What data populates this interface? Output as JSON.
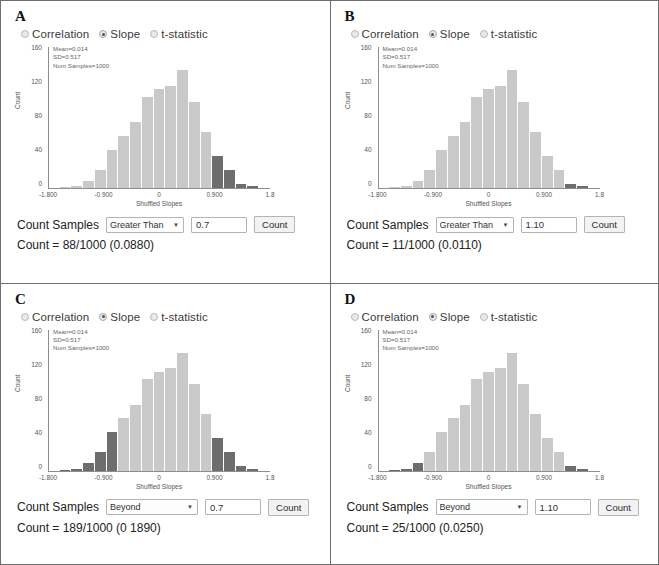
{
  "figure": {
    "panels": [
      {
        "letter": "A",
        "radios": [
          {
            "label": "Correlation",
            "selected": false,
            "italic_first": false
          },
          {
            "label": "Slope",
            "selected": true,
            "italic_first": false
          },
          {
            "label": "t-statistic",
            "selected": false,
            "italic_first": true
          }
        ],
        "stats": {
          "mean": "Mean=0.014",
          "sd": "SD=0.517",
          "num": "Num Samples=1000"
        },
        "controls": {
          "label": "Count Samples",
          "dropdown_value": "Greater Than",
          "dropdown_options": [
            "Greater Than",
            "Less Than",
            "Beyond",
            "Between"
          ],
          "input_value": "0.7",
          "button": "Count"
        },
        "result": "Count = 88/1000 (0.0880)"
      },
      {
        "letter": "B",
        "radios": [
          {
            "label": "Correlation",
            "selected": false,
            "italic_first": false
          },
          {
            "label": "Slope",
            "selected": true,
            "italic_first": false
          },
          {
            "label": "t-statistic",
            "selected": false,
            "italic_first": true
          }
        ],
        "stats": {
          "mean": "Mean=0.014",
          "sd": "SD=0.517",
          "num": "Num Samples=1000"
        },
        "controls": {
          "label": "Count Samples",
          "dropdown_value": "Greater Than",
          "dropdown_options": [
            "Greater Than",
            "Less Than",
            "Beyond",
            "Between"
          ],
          "input_value": "1.10",
          "button": "Count"
        },
        "result": "Count = 11/1000 (0.0110)"
      },
      {
        "letter": "C",
        "radios": [
          {
            "label": "Correlation",
            "selected": false,
            "italic_first": false
          },
          {
            "label": "Slope",
            "selected": true,
            "italic_first": false
          },
          {
            "label": "t-statistic",
            "selected": false,
            "italic_first": true
          }
        ],
        "stats": {
          "mean": "Mean=0.014",
          "sd": "SD=0.517",
          "num": "Num Samples=1000"
        },
        "controls": {
          "label": "Count Samples",
          "dropdown_value": "Beyond",
          "dropdown_options": [
            "Greater Than",
            "Less Than",
            "Beyond",
            "Between"
          ],
          "input_value": "0.7",
          "button": "Count"
        },
        "result": "Count = 189/1000 (0 1890)"
      },
      {
        "letter": "D",
        "radios": [
          {
            "label": "Correlation",
            "selected": false,
            "italic_first": false
          },
          {
            "label": "Slope",
            "selected": true,
            "italic_first": false
          },
          {
            "label": "t-statistic",
            "selected": false,
            "italic_first": true
          }
        ],
        "stats": {
          "mean": "Mean=0.014",
          "sd": "SD=0.517",
          "num": "Num Samples=1000"
        },
        "controls": {
          "label": "Count Samples",
          "dropdown_value": "Beyond",
          "dropdown_options": [
            "Greater Than",
            "Less Than",
            "Beyond",
            "Between"
          ],
          "input_value": "1.10",
          "button": "Count"
        },
        "result": "Count = 25/1000 (0.0250)"
      }
    ]
  },
  "chart_data": [
    {
      "type": "bar",
      "panel": "A",
      "title": "",
      "xlabel": "Shuffled Slopes",
      "ylabel": "Count",
      "xlim": [
        -1.8,
        1.8
      ],
      "ylim": [
        0,
        170
      ],
      "xticks": [
        "-1.800",
        "-0.900",
        "0",
        "0.900",
        "1.8"
      ],
      "xtick_values": [
        -1.8,
        -0.9,
        0,
        0.9,
        1.8
      ],
      "yticks": [
        0,
        40,
        80,
        120,
        160
      ],
      "grid": false,
      "legend": "none",
      "bin_centers": [
        -1.62,
        -1.44,
        -1.26,
        -1.08,
        -0.9,
        -0.72,
        -0.54,
        -0.36,
        -0.18,
        0,
        0.18,
        0.36,
        0.54,
        0.72,
        0.9,
        1.08,
        1.26,
        1.44,
        1.62
      ],
      "values": [
        0,
        1,
        2,
        9,
        22,
        46,
        63,
        79,
        110,
        119,
        123,
        142,
        104,
        68,
        39,
        22,
        5,
        2,
        0
      ],
      "highlighted_bins": [
        14,
        15,
        16,
        17,
        18
      ],
      "highlight_rule": "Greater Than 0.7",
      "bar_color": "#c9c9c9",
      "highlight_color": "#6d6d6d",
      "annotations": [
        "Mean=0.014",
        "SD=0.517",
        "Num Samples=1000"
      ]
    },
    {
      "type": "bar",
      "panel": "B",
      "title": "",
      "xlabel": "Shuffled Slopes",
      "ylabel": "Count",
      "xlim": [
        -1.8,
        1.8
      ],
      "ylim": [
        0,
        170
      ],
      "xticks": [
        "-1.800",
        "-0.900",
        "0",
        "0.900",
        "1.8"
      ],
      "xtick_values": [
        -1.8,
        -0.9,
        0,
        0.9,
        1.8
      ],
      "yticks": [
        0,
        40,
        80,
        120,
        160
      ],
      "grid": false,
      "legend": "none",
      "bin_centers": [
        -1.62,
        -1.44,
        -1.26,
        -1.08,
        -0.9,
        -0.72,
        -0.54,
        -0.36,
        -0.18,
        0,
        0.18,
        0.36,
        0.54,
        0.72,
        0.9,
        1.08,
        1.26,
        1.44,
        1.62
      ],
      "values": [
        0,
        1,
        2,
        9,
        22,
        46,
        63,
        79,
        110,
        119,
        123,
        142,
        104,
        68,
        39,
        22,
        5,
        2,
        0
      ],
      "highlighted_bins": [
        16,
        17,
        18
      ],
      "highlight_rule": "Greater Than 1.10",
      "bar_color": "#c9c9c9",
      "highlight_color": "#6d6d6d",
      "annotations": [
        "Mean=0.014",
        "SD=0.517",
        "Num Samples=1000"
      ]
    },
    {
      "type": "bar",
      "panel": "C",
      "title": "",
      "xlabel": "Shuffled Slopes",
      "ylabel": "Count",
      "xlim": [
        -1.8,
        1.8
      ],
      "ylim": [
        0,
        170
      ],
      "xticks": [
        "-1.800",
        "-0.900",
        "0",
        "0.900",
        "1.8"
      ],
      "xtick_values": [
        -1.8,
        -0.9,
        0,
        0.9,
        1.8
      ],
      "yticks": [
        0,
        40,
        80,
        120,
        160
      ],
      "grid": false,
      "legend": "none",
      "bin_centers": [
        -1.62,
        -1.44,
        -1.26,
        -1.08,
        -0.9,
        -0.72,
        -0.54,
        -0.36,
        -0.18,
        0,
        0.18,
        0.36,
        0.54,
        0.72,
        0.9,
        1.08,
        1.26,
        1.44,
        1.62
      ],
      "values": [
        0,
        1,
        2,
        9,
        22,
        46,
        63,
        79,
        110,
        119,
        123,
        142,
        104,
        68,
        39,
        22,
        5,
        2,
        0
      ],
      "highlighted_bins": [
        0,
        1,
        2,
        3,
        4,
        5,
        14,
        15,
        16,
        17,
        18
      ],
      "highlight_rule": "Beyond 0.7",
      "bar_color": "#c9c9c9",
      "highlight_color": "#6d6d6d",
      "annotations": [
        "Mean=0.014",
        "SD=0.517",
        "Num Samples=1000"
      ]
    },
    {
      "type": "bar",
      "panel": "D",
      "title": "",
      "xlabel": "Shuffled Slopes",
      "ylabel": "Count",
      "xlim": [
        -1.8,
        1.8
      ],
      "ylim": [
        0,
        170
      ],
      "xticks": [
        "-1.800",
        "-0.900",
        "0",
        "0.900",
        "1.8"
      ],
      "xtick_values": [
        -1.8,
        -0.9,
        0,
        0.9,
        1.8
      ],
      "yticks": [
        0,
        40,
        80,
        120,
        160
      ],
      "grid": false,
      "legend": "none",
      "bin_centers": [
        -1.62,
        -1.44,
        -1.26,
        -1.08,
        -0.9,
        -0.72,
        -0.54,
        -0.36,
        -0.18,
        0,
        0.18,
        0.36,
        0.54,
        0.72,
        0.9,
        1.08,
        1.26,
        1.44,
        1.62
      ],
      "values": [
        0,
        1,
        2,
        9,
        22,
        46,
        63,
        79,
        110,
        119,
        123,
        142,
        104,
        68,
        39,
        22,
        5,
        2,
        0
      ],
      "highlighted_bins": [
        0,
        1,
        2,
        3,
        16,
        17,
        18
      ],
      "highlight_rule": "Beyond 1.10",
      "bar_color": "#c9c9c9",
      "highlight_color": "#6d6d6d",
      "annotations": [
        "Mean=0.014",
        "SD=0.517",
        "Num Samples=1000"
      ]
    }
  ]
}
